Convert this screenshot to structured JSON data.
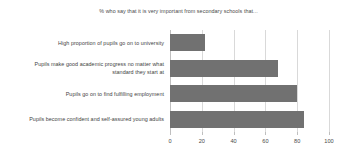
{
  "chart_data": {
    "type": "bar",
    "orientation": "horizontal",
    "title": "% who say that it is very important from secondary schools that...",
    "xlabel": "",
    "ylabel": "",
    "xlim": [
      0,
      100
    ],
    "xticks": [
      0,
      20,
      40,
      60,
      80,
      100
    ],
    "xtick_labels": [
      "0",
      "20",
      "40",
      "60",
      "80",
      "100"
    ],
    "grid": true,
    "legend": false,
    "bar_color": "#717171",
    "categories": [
      "High proportion of pupils go on to university",
      "Pupils make good academic progress no matter what standard they start at",
      "Pupils go on to find fulfilling employment",
      "Pupils become confident and self-assured young adults"
    ],
    "values": [
      22,
      68,
      80,
      84
    ]
  },
  "artifact": {
    "bottom_left_mark": ""
  }
}
